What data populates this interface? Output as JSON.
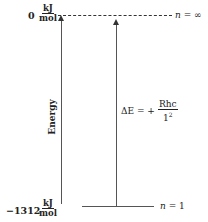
{
  "levels": [
    {
      "value": "0",
      "unit_num": "kJ",
      "unit_den": "mol",
      "n_label": "n",
      "n_eq": "= ∞",
      "style": "dashed"
    },
    {
      "value": "−1312",
      "unit_num": "kJ",
      "unit_den": "mol",
      "n_label": "n",
      "n_eq": "= 1",
      "style": "solid"
    }
  ],
  "axis_label": "Energy",
  "formula": {
    "lhs": "ΔE = +",
    "num": "Rhc",
    "den_base": "1",
    "den_exp": "2"
  }
}
